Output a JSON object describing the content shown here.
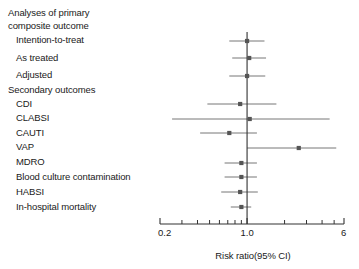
{
  "figure": {
    "type": "forest-plot",
    "background": "#ffffff",
    "marker_color": "#555555",
    "line_color": "#777777",
    "axis_color": "#333333",
    "reference_line_value": 1.0
  },
  "rows": [
    {
      "label": "Analyses of primary",
      "kind": "header",
      "indent": 0
    },
    {
      "label": "composite outcome",
      "kind": "header",
      "indent": 0
    },
    {
      "label": "Intention-to-treat",
      "kind": "item",
      "indent": 1
    },
    {
      "label": "As treated",
      "kind": "item",
      "indent": 1
    },
    {
      "label": "Adjusted",
      "kind": "item",
      "indent": 1
    },
    {
      "label": "Secondary outcomes",
      "kind": "header",
      "indent": 0
    },
    {
      "label": "CDI",
      "kind": "item",
      "indent": 1
    },
    {
      "label": "CLABSI",
      "kind": "item",
      "indent": 1
    },
    {
      "label": "CAUTI",
      "kind": "item",
      "indent": 1
    },
    {
      "label": "VAP",
      "kind": "item",
      "indent": 1
    },
    {
      "label": "MDRO",
      "kind": "item",
      "indent": 1
    },
    {
      "label": "Blood culture contamination",
      "kind": "item",
      "indent": 1
    },
    {
      "label": "HABSI",
      "kind": "item",
      "indent": 1
    },
    {
      "label": "In-hospital mortality",
      "kind": "item",
      "indent": 1
    }
  ],
  "axis": {
    "label": "Risk ratio(95% CI)",
    "scale": "log",
    "min": 0.2,
    "max": 6,
    "tick_labels": [
      "0.2",
      "1.0",
      "6"
    ],
    "tick_values": [
      0.2,
      1.0,
      6
    ],
    "minor_tick_values": [
      0.3,
      0.4,
      0.5,
      0.6,
      0.7,
      0.8,
      0.9,
      2,
      3,
      4,
      5
    ]
  },
  "chart_data": {
    "type": "forest",
    "title": "",
    "xlabel": "Risk ratio(95% CI)",
    "ylabel": "",
    "xscale": "log",
    "xlim": [
      0.2,
      6
    ],
    "reference_line": 1.0,
    "grid": false,
    "legend": "none",
    "categories": [
      "Intention-to-treat",
      "As treated",
      "Adjusted",
      "CDI",
      "CLABSI",
      "CAUTI",
      "VAP",
      "MDRO",
      "Blood culture contamination",
      "HABSI",
      "In-hospital mortality"
    ],
    "series": [
      {
        "name": "Risk ratio (95% CI)",
        "points": [
          {
            "category": "Intention-to-treat",
            "estimate": 1.0,
            "ci_low": 0.72,
            "ci_high": 1.38
          },
          {
            "category": "As treated",
            "estimate": 1.04,
            "ci_low": 0.76,
            "ci_high": 1.42
          },
          {
            "category": "Adjusted",
            "estimate": 1.0,
            "ci_low": 0.72,
            "ci_high": 1.4
          },
          {
            "category": "CDI",
            "estimate": 0.88,
            "ci_low": 0.48,
            "ci_high": 1.72
          },
          {
            "category": "CLABSI",
            "estimate": 1.05,
            "ci_low": 0.25,
            "ci_high": 4.6
          },
          {
            "category": "CAUTI",
            "estimate": 0.72,
            "ci_low": 0.42,
            "ci_high": 1.2
          },
          {
            "category": "VAP",
            "estimate": 2.6,
            "ci_low": 1.0,
            "ci_high": 5.2
          },
          {
            "category": "MDRO",
            "estimate": 0.9,
            "ci_low": 0.66,
            "ci_high": 1.2
          },
          {
            "category": "Blood culture contamination",
            "estimate": 0.9,
            "ci_low": 0.66,
            "ci_high": 1.2
          },
          {
            "category": "HABSI",
            "estimate": 0.88,
            "ci_low": 0.62,
            "ci_high": 1.22
          },
          {
            "category": "In-hospital mortality",
            "estimate": 0.9,
            "ci_low": 0.74,
            "ci_high": 1.08
          }
        ]
      }
    ]
  }
}
